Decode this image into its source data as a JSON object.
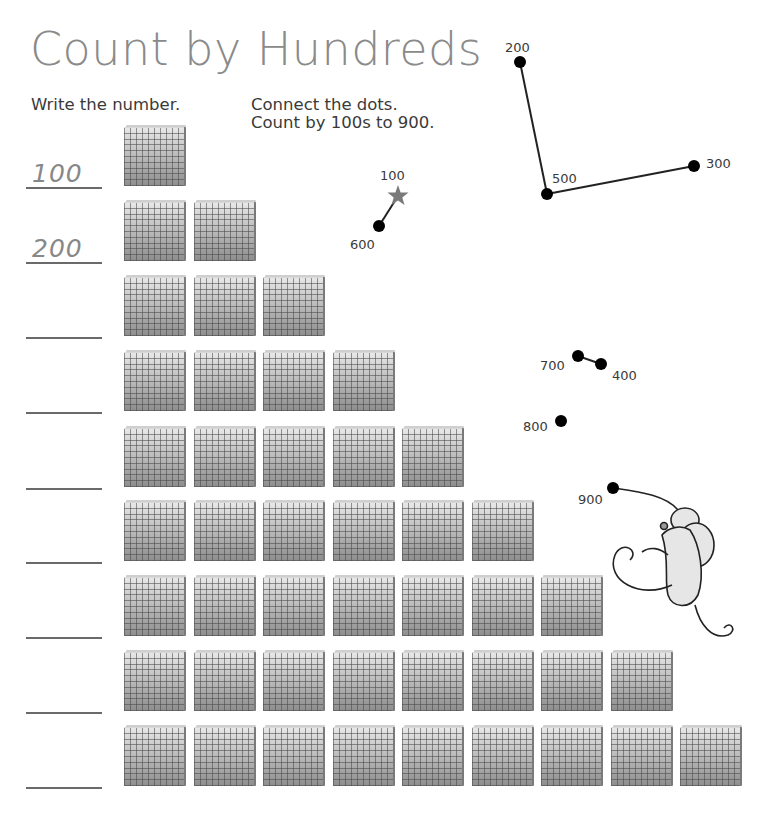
{
  "title": "Count by Hundreds",
  "instructions": {
    "left": "Write the number.",
    "right_line1": "Connect the dots.",
    "right_line2": "Count by 100s to 900."
  },
  "rows": [
    {
      "flats": 1,
      "answer": "100"
    },
    {
      "flats": 2,
      "answer": "200"
    },
    {
      "flats": 3,
      "answer": ""
    },
    {
      "flats": 4,
      "answer": ""
    },
    {
      "flats": 5,
      "answer": ""
    },
    {
      "flats": 6,
      "answer": ""
    },
    {
      "flats": 7,
      "answer": ""
    },
    {
      "flats": 8,
      "answer": ""
    },
    {
      "flats": 9,
      "answer": ""
    }
  ],
  "dots": [
    {
      "label": "100",
      "x": 398,
      "y": 196,
      "shape": "star",
      "lx": 380,
      "ly": 180
    },
    {
      "label": "200",
      "x": 520,
      "y": 62,
      "shape": "dot",
      "lx": 505,
      "ly": 52
    },
    {
      "label": "300",
      "x": 694,
      "y": 166,
      "shape": "dot",
      "lx": 706,
      "ly": 168
    },
    {
      "label": "400",
      "x": 601,
      "y": 364,
      "shape": "dot",
      "lx": 612,
      "ly": 380
    },
    {
      "label": "500",
      "x": 547,
      "y": 194,
      "shape": "dot",
      "lx": 552,
      "ly": 183
    },
    {
      "label": "600",
      "x": 379,
      "y": 226,
      "shape": "dot",
      "lx": 350,
      "ly": 249
    },
    {
      "label": "700",
      "x": 578,
      "y": 356,
      "shape": "dot",
      "lx": 540,
      "ly": 370
    },
    {
      "label": "800",
      "x": 561,
      "y": 421,
      "shape": "dot",
      "lx": 523,
      "ly": 431
    },
    {
      "label": "900",
      "x": 613,
      "y": 488,
      "shape": "dot",
      "lx": 578,
      "ly": 504
    }
  ],
  "drawn_segments": [
    [
      "100",
      "600"
    ],
    [
      "200",
      "500"
    ],
    [
      "500",
      "300"
    ],
    [
      "700",
      "400"
    ]
  ],
  "colors": {
    "title": "#8a8a8a",
    "text": "#3a3a3a",
    "star": "#7a7a7a",
    "dot": "#000000"
  }
}
